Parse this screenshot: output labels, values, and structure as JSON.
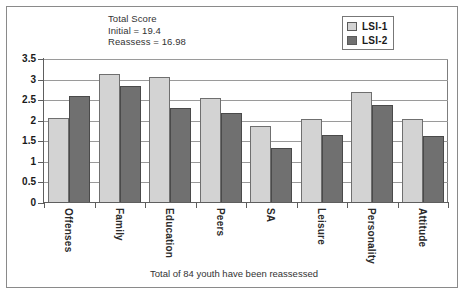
{
  "chart_data": {
    "type": "bar",
    "title": "",
    "subtitle": "",
    "xlabel": "",
    "ylabel": "",
    "ylim": [
      0,
      3.5
    ],
    "ytick_labels": [
      "0",
      "0.5",
      "1",
      "1.5",
      "2",
      "2.5",
      "3",
      "3.5"
    ],
    "ytick_values": [
      0,
      0.5,
      1,
      1.5,
      2,
      2.5,
      3,
      3.5
    ],
    "grid": true,
    "legend_position": "top-right",
    "categories": [
      "Offenses",
      "Family",
      "Education",
      "Peers",
      "SA",
      "Leisure",
      "Personality",
      "Attitude"
    ],
    "series": [
      {
        "name": "LSI-1",
        "color": "#d3d3d3",
        "values": [
          2.07,
          3.14,
          3.06,
          2.56,
          1.88,
          2.04,
          2.69,
          2.05
        ]
      },
      {
        "name": "LSI-2",
        "color": "#707070",
        "values": [
          2.6,
          2.85,
          2.3,
          2.2,
          1.33,
          1.66,
          2.39,
          1.62
        ]
      }
    ],
    "annotations": [
      "Total Score",
      "Initial = 19.4",
      "Reassess = 16.98"
    ],
    "footer": "Total of 84 youth have been reassessed"
  },
  "annotation": {
    "line1": "Total Score",
    "line2": "Initial = 19.4",
    "line3": "Reassess = 16.98"
  },
  "legend": {
    "items": [
      {
        "label": "LSI-1",
        "color": "#d3d3d3"
      },
      {
        "label": "LSI-2",
        "color": "#707070"
      }
    ]
  },
  "footer": {
    "text": "Total of 84 youth have been reassessed"
  }
}
